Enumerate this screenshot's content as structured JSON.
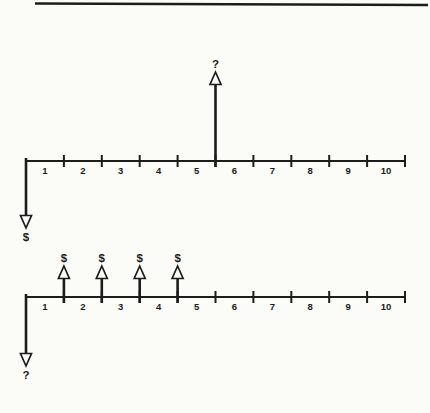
{
  "figure": {
    "type": "cash-flow-timeline-pair",
    "ink_color": "#1c1c1c",
    "paper_color": "#fbfbf7",
    "top_rule": {
      "present": true
    },
    "timelines": [
      {
        "id": "upper",
        "tick_labels": [
          "1",
          "2",
          "3",
          "4",
          "5",
          "6",
          "7",
          "8",
          "9",
          "10"
        ],
        "up_arrows": [
          {
            "at_tick": 5,
            "label": "?",
            "size": "tall"
          }
        ],
        "down_arrows": [
          {
            "at_tick": 0,
            "label": "$"
          }
        ]
      },
      {
        "id": "lower",
        "tick_labels": [
          "1",
          "2",
          "3",
          "4",
          "5",
          "6",
          "7",
          "8",
          "9",
          "10"
        ],
        "up_arrows": [
          {
            "at_tick": 1,
            "label": "$",
            "size": "short"
          },
          {
            "at_tick": 2,
            "label": "$",
            "size": "short"
          },
          {
            "at_tick": 3,
            "label": "$",
            "size": "short"
          },
          {
            "at_tick": 4,
            "label": "$",
            "size": "short"
          }
        ],
        "down_arrows": [
          {
            "at_tick": 0,
            "label": "?"
          }
        ]
      }
    ]
  }
}
